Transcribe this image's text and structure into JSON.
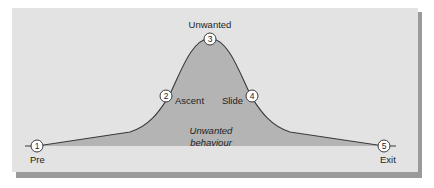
{
  "diagram": {
    "colors": {
      "panel": "#e3e3e3",
      "shadow": "#9a9a9a",
      "fill": "#b4b4b4",
      "line": "#3a3a3a"
    },
    "points": [
      {
        "number": "1",
        "label": "Pre"
      },
      {
        "number": "2",
        "label": "Ascent"
      },
      {
        "number": "3",
        "label": "Unwanted"
      },
      {
        "number": "4",
        "label": "Slide"
      },
      {
        "number": "5",
        "label": "Exit"
      }
    ],
    "area_label": {
      "line1": "Unwanted",
      "line2": "behaviour"
    }
  }
}
